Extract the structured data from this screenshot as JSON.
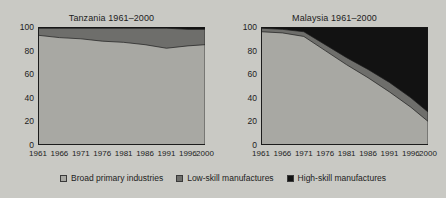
{
  "figure": {
    "background_color": "#c9c9c4",
    "text_color": "#1c1c1c"
  },
  "legend": {
    "position": "bottom-center",
    "items": [
      {
        "label": "Broad primary industries",
        "color": "#a8a8a3",
        "swatch_name": "legend-swatch-broad-primary-industries"
      },
      {
        "label": "Low-skill manufactures",
        "color": "#6e6e6b",
        "swatch_name": "legend-swatch-low-skill-manufactures"
      },
      {
        "label": "High-skill manufactures",
        "color": "#121212",
        "swatch_name": "legend-swatch-high-skill-manufactures"
      }
    ]
  },
  "chart_data": [
    {
      "type": "area",
      "title": "Tanzania 1961–2000",
      "xlabel": "",
      "ylabel": "",
      "xlim": [
        1961,
        2000
      ],
      "ylim": [
        0,
        100
      ],
      "grid": false,
      "stacked": true,
      "x": [
        1961,
        1966,
        1971,
        1976,
        1981,
        1986,
        1991,
        1996,
        2000
      ],
      "xticks": [
        "1961",
        "1966",
        "1971",
        "1976",
        "1981",
        "1986",
        "1991",
        "1996",
        "2000"
      ],
      "yticks": [
        "0",
        "20",
        "40",
        "60",
        "80",
        "100"
      ],
      "series": [
        {
          "name": "Broad primary industries",
          "color": "#a8a8a3",
          "values": [
            93,
            91,
            90,
            88,
            87,
            85,
            82,
            84,
            85
          ]
        },
        {
          "name": "Low-skill manufactures",
          "color": "#6e6e6b",
          "values": [
            6,
            8,
            9,
            11,
            12,
            14,
            17,
            14,
            13
          ]
        },
        {
          "name": "High-skill manufactures",
          "color": "#121212",
          "values": [
            1,
            1,
            1,
            1,
            1,
            1,
            1,
            2,
            2
          ]
        }
      ]
    },
    {
      "type": "area",
      "title": "Malaysia 1961–2000",
      "xlabel": "",
      "ylabel": "",
      "xlim": [
        1961,
        2000
      ],
      "ylim": [
        0,
        100
      ],
      "grid": false,
      "stacked": true,
      "x": [
        1961,
        1966,
        1971,
        1976,
        1981,
        1986,
        1991,
        1996,
        2000
      ],
      "xticks": [
        "1961",
        "1966",
        "1971",
        "1976",
        "1981",
        "1986",
        "1991",
        "1996",
        "2000"
      ],
      "yticks": [
        "0",
        "20",
        "40",
        "60",
        "80",
        "100"
      ],
      "series": [
        {
          "name": "Broad primary industries",
          "color": "#a8a8a3",
          "values": [
            96,
            95,
            92,
            80,
            68,
            57,
            45,
            32,
            20
          ]
        },
        {
          "name": "Low-skill manufactures",
          "color": "#6e6e6b",
          "values": [
            3,
            3,
            4,
            5,
            6,
            7,
            8,
            8,
            8
          ]
        },
        {
          "name": "High-skill manufactures",
          "color": "#121212",
          "values": [
            1,
            2,
            4,
            15,
            26,
            36,
            47,
            60,
            72
          ]
        }
      ]
    }
  ]
}
